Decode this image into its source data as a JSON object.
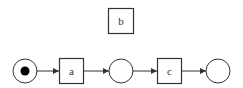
{
  "diagram": {
    "type": "petri-net",
    "colors": {
      "stroke": "#333333",
      "token": "#000000",
      "background": "#ffffff"
    },
    "places": [
      {
        "id": "p1",
        "cx": 25,
        "cy": 71,
        "r": 12,
        "token": true
      },
      {
        "id": "p2",
        "cx": 121,
        "cy": 71,
        "r": 12,
        "token": false
      },
      {
        "id": "p3",
        "cx": 218,
        "cy": 71,
        "r": 12,
        "token": false
      }
    ],
    "transitions": [
      {
        "id": "t_b",
        "label": "b",
        "x": 108,
        "y": 8,
        "w": 26,
        "h": 25
      },
      {
        "id": "t_a",
        "label": "a",
        "x": 59,
        "y": 58,
        "w": 25,
        "h": 26
      },
      {
        "id": "t_c",
        "label": "c",
        "x": 157,
        "y": 58,
        "w": 25,
        "h": 26
      }
    ],
    "arcs": [
      {
        "from": "p1",
        "to": "t_a"
      },
      {
        "from": "t_a",
        "to": "p2"
      },
      {
        "from": "p2",
        "to": "t_c"
      },
      {
        "from": "t_c",
        "to": "p3"
      }
    ]
  }
}
